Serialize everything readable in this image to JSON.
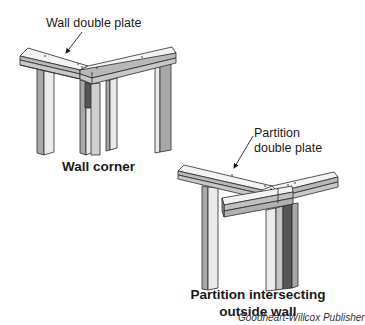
{
  "figure_1": {
    "callout": "Wall double plate",
    "caption": "Wall corner"
  },
  "figure_2": {
    "callout_line1": "Partition",
    "callout_line2": "double plate",
    "caption_line1": "Partition intersecting",
    "caption_line2": "outside wall"
  },
  "credit": "Goodheart-Willcox Publisher",
  "colors": {
    "outline": "#2b2b2b",
    "plate_top": "#f2f2f2",
    "plate_side": "#b5b5b5",
    "stud_light": "#e6e6e6",
    "stud_mid": "#a8a8a8",
    "stud_dark": "#555555"
  }
}
